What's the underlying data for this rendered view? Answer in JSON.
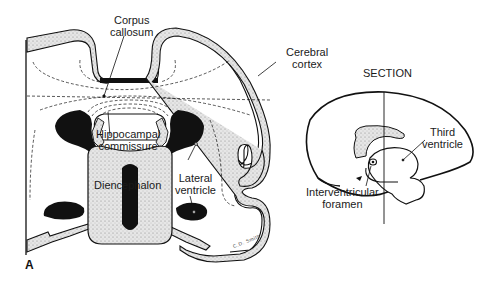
{
  "figure": {
    "panel_letter": "A",
    "signature": "C.D. Smith",
    "coronal_section": {
      "labels": {
        "corpus_callosum_line1": "Corpus",
        "corpus_callosum_line2": "callosum",
        "cerebral_cortex_line1": "Cerebral",
        "cerebral_cortex_line2": "cortex",
        "hippocampal_commissure_line1": "Hippocampal",
        "hippocampal_commissure_line2": "commissure",
        "diencephalon": "Diencephalon",
        "lateral_ventricle_line1": "Lateral",
        "lateral_ventricle_line2": "ventricle"
      }
    },
    "sagittal_view": {
      "labels": {
        "section": "SECTION",
        "third_ventricle_line1": "Third",
        "third_ventricle_line2": "ventricle",
        "interventricular_foramen_line1": "Interventricular",
        "interventricular_foramen_line2": "foramen"
      }
    },
    "colors": {
      "ink": "#111111",
      "stipple": "#d8d8d8",
      "background": "#ffffff"
    }
  }
}
